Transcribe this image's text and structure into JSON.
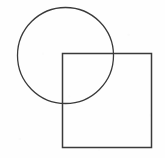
{
  "figure": {
    "background_color": "#fefefe",
    "stroke_color": "#3a3a3a",
    "canvas": {
      "width": 165,
      "height": 158
    },
    "shapes": [
      {
        "name": "circle",
        "type": "circle",
        "cx": 65.5,
        "cy": 55.5,
        "r": 48,
        "stroke": "#3a3a3a",
        "stroke_width": 1.3,
        "fill": "none"
      },
      {
        "name": "square",
        "type": "rect",
        "x": 62.5,
        "y": 53.5,
        "width": 89,
        "height": 94,
        "stroke": "#3a3a3a",
        "stroke_width": 1.5,
        "fill": "none"
      }
    ]
  }
}
